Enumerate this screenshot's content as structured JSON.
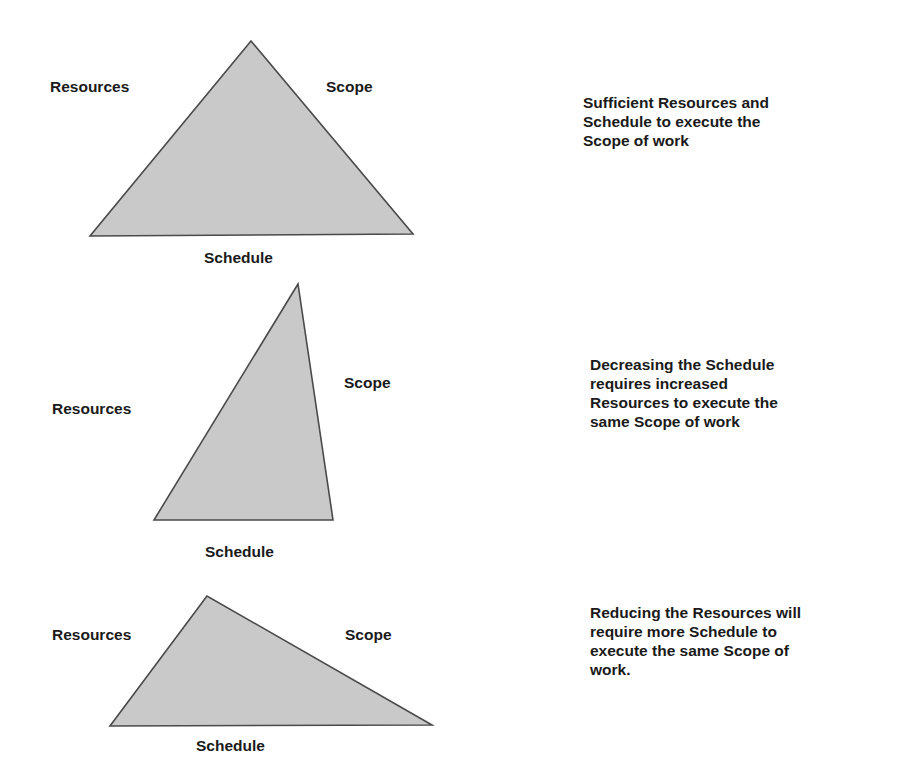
{
  "panels": [
    {
      "triangle": {
        "points": "251,41 90,236 413,234",
        "fill": "#c9c9c9",
        "stroke": "#4a4a4a"
      },
      "labels": {
        "resources": "Resources",
        "scope": "Scope",
        "schedule": "Schedule"
      },
      "description": [
        "Sufficient Resources and",
        "Schedule to execute the",
        "Scope of work"
      ]
    },
    {
      "triangle": {
        "points": "298,284 154,520 333,520",
        "fill": "#c9c9c9",
        "stroke": "#4a4a4a"
      },
      "labels": {
        "resources": "Resources",
        "scope": "Scope",
        "schedule": "Schedule"
      },
      "description": [
        "Decreasing the Schedule",
        "requires increased",
        "Resources to execute the",
        "same Scope of work"
      ]
    },
    {
      "triangle": {
        "points": "207,596 110,726 432,725",
        "fill": "#c9c9c9",
        "stroke": "#4a4a4a"
      },
      "labels": {
        "resources": "Resources",
        "scope": "Scope",
        "schedule": "Schedule"
      },
      "description": [
        "Reducing the Resources will",
        "require more Schedule to",
        "execute the same Scope of",
        "work."
      ]
    }
  ]
}
